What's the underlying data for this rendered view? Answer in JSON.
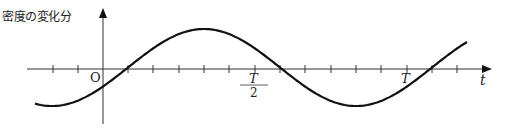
{
  "diagram": {
    "y_axis_label": "密度の変化分",
    "x_axis_label": "t",
    "origin_label": "O",
    "tick_labels": {
      "half_period_numerator": "T",
      "half_period_denominator": "2",
      "period": "T"
    },
    "curve": "sinusoidal wave: density change vs time, period T, crosses zero slightly after origin",
    "colors": {
      "line": "#111111",
      "background": "#ffffff"
    }
  }
}
